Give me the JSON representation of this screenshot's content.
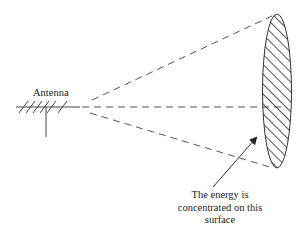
{
  "diagram": {
    "antenna_label": "Antenna",
    "energy_label_line1": "The energy is",
    "energy_label_line2": "concentrated on this",
    "energy_label_line3": "surface",
    "elements": [
      {
        "name": "antenna",
        "type": "yagi-antenna-icon"
      },
      {
        "name": "beam-upper-edge",
        "type": "dashed-line"
      },
      {
        "name": "beam-axis",
        "type": "dashed-line"
      },
      {
        "name": "beam-lower-edge",
        "type": "dashed-line"
      },
      {
        "name": "target-surface",
        "type": "hatched-ellipse"
      },
      {
        "name": "pointer-arrow",
        "type": "arrow"
      }
    ],
    "colors": {
      "line": "#3a3a3a",
      "text": "#222222",
      "background": "#ffffff"
    }
  }
}
